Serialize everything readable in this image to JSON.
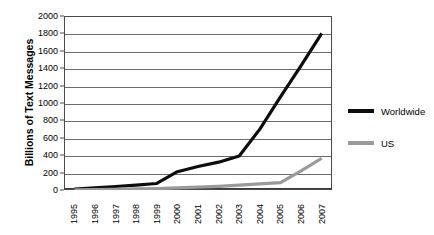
{
  "chart_data": {
    "type": "line",
    "title": "",
    "xlabel": "",
    "ylabel": "Billions of Text Messages",
    "categories": [
      "1995",
      "1996",
      "1997",
      "1998",
      "1999",
      "2000",
      "2001",
      "2002",
      "2003",
      "2004",
      "2005",
      "2006",
      "2007"
    ],
    "x": [
      1995,
      1996,
      1997,
      1998,
      1999,
      2000,
      2001,
      2002,
      2003,
      2004,
      2005,
      2006,
      2007
    ],
    "series": [
      {
        "name": "Worldwide",
        "color": "#0d0d0d",
        "values": [
          10,
          25,
          40,
          55,
          75,
          210,
          270,
          320,
          390,
          700,
          1070,
          1430,
          1800
        ]
      },
      {
        "name": "US",
        "color": "#9a9a9a",
        "values": [
          2,
          5,
          8,
          12,
          16,
          24,
          32,
          42,
          55,
          70,
          85,
          220,
          365
        ]
      }
    ],
    "ylim": [
      0,
      2000
    ],
    "yticks": [
      0,
      200,
      400,
      600,
      800,
      1000,
      1200,
      1400,
      1600,
      1800,
      2000
    ],
    "ytick_labels": [
      "0",
      "200",
      "400",
      "600",
      "800",
      "1000",
      "1200",
      "1400",
      "1600",
      "1800",
      "2000"
    ],
    "grid": true,
    "grid_axis": "y",
    "legend_position": "right-outside",
    "legend": [
      "Worldwide",
      "US"
    ],
    "xtick_rotation": 90
  },
  "legend": {
    "items": [
      {
        "label": "Worldwide",
        "color": "#0d0d0d"
      },
      {
        "label": "US",
        "color": "#9a9a9a"
      }
    ]
  },
  "axes": {
    "y_title": "Billions of Text Messages"
  }
}
